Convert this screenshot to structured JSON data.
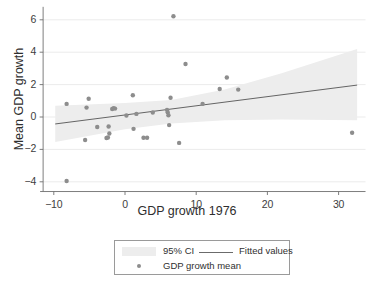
{
  "chart_data": {
    "type": "scatter",
    "title": "",
    "xlabel": "GDP growth 1976",
    "ylabel": "Mean GDP growth",
    "xlim": [
      -11.5,
      33.5
    ],
    "ylim": [
      -4.6,
      6.8
    ],
    "xticks": [
      -10,
      0,
      10,
      20,
      30
    ],
    "xtick_labels": [
      "−10",
      "0",
      "10",
      "20",
      "30"
    ],
    "yticks": [
      -4,
      -2,
      0,
      2,
      4,
      6
    ],
    "ytick_labels": [
      "−4",
      "−2",
      "0",
      "2",
      "4",
      "6"
    ],
    "grid": true,
    "legend_position": "below-plot",
    "series": [
      {
        "name": "GDP growth mean",
        "type": "scatter",
        "color": "#8d8d8d",
        "points": [
          [
            -8.2,
            -3.95
          ],
          [
            -8.2,
            0.81
          ],
          [
            -5.6,
            -1.42
          ],
          [
            -5.4,
            0.58
          ],
          [
            -5.1,
            1.13
          ],
          [
            -3.9,
            -0.62
          ],
          [
            -2.6,
            -1.3
          ],
          [
            -2.4,
            -1.27
          ],
          [
            -2.3,
            -0.59
          ],
          [
            -2.2,
            -1.02
          ],
          [
            -1.8,
            0.49
          ],
          [
            -1.6,
            0.55
          ],
          [
            -1.4,
            0.52
          ],
          [
            0.2,
            0.09
          ],
          [
            1.1,
            1.34
          ],
          [
            1.2,
            -0.73
          ],
          [
            1.6,
            0.19
          ],
          [
            2.6,
            -1.28
          ],
          [
            3.1,
            -1.28
          ],
          [
            3.9,
            0.28
          ],
          [
            5.9,
            0.44
          ],
          [
            6.0,
            0.3
          ],
          [
            6.1,
            0.11
          ],
          [
            6.2,
            -0.5
          ],
          [
            6.4,
            1.19
          ],
          [
            6.8,
            6.22
          ],
          [
            7.6,
            -1.6
          ],
          [
            8.5,
            3.27
          ],
          [
            10.9,
            0.81
          ],
          [
            13.3,
            1.73
          ],
          [
            14.3,
            2.44
          ],
          [
            15.9,
            1.69
          ],
          [
            31.9,
            -0.97
          ]
        ]
      },
      {
        "name": "Fitted values",
        "type": "line",
        "color": "#555555",
        "endpoints": [
          [
            -9.8,
            -0.43
          ],
          [
            32.6,
            1.97
          ]
        ]
      },
      {
        "name": "95% CI",
        "type": "band",
        "color": "#ededed",
        "x": [
          -9.8,
          0.0,
          6.5,
          14.0,
          22.0,
          32.6
        ],
        "lower": [
          -1.55,
          -0.75,
          -0.4,
          -0.2,
          -0.15,
          -0.2
        ],
        "upper": [
          0.7,
          0.86,
          1.05,
          1.7,
          2.7,
          4.2
        ]
      }
    ]
  },
  "legend": {
    "entries": [
      {
        "label": "95% CI",
        "marker": "band"
      },
      {
        "label": "Fitted values",
        "marker": "line"
      },
      {
        "label": "GDP growth mean",
        "marker": "dot"
      }
    ]
  }
}
